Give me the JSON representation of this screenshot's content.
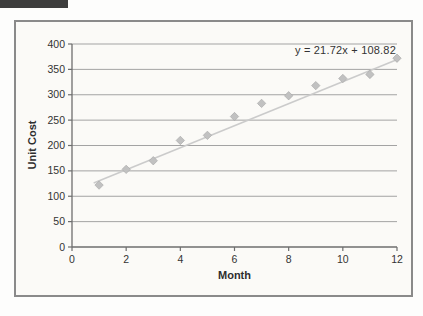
{
  "page": {
    "header_bar_color": "#3d3d3d"
  },
  "chart_data": {
    "type": "scatter",
    "title": "",
    "xlabel": "Month",
    "ylabel": "Unit Cost",
    "x": [
      1,
      2,
      3,
      4,
      5,
      6,
      7,
      8,
      9,
      10,
      11,
      12
    ],
    "y": [
      122,
      153,
      170,
      210,
      220,
      257,
      283,
      298,
      318,
      332,
      340,
      372
    ],
    "trendline": {
      "label": "y = 21.72x + 108.82",
      "slope": 21.72,
      "intercept": 108.82,
      "x_start": 0.8,
      "x_end": 12.1
    },
    "xlim": [
      0,
      12
    ],
    "ylim": [
      0,
      400
    ],
    "x_ticks": [
      0,
      2,
      4,
      6,
      8,
      10,
      12
    ],
    "y_ticks": [
      0,
      50,
      100,
      150,
      200,
      250,
      300,
      350,
      400
    ],
    "grid": "horizontal",
    "legend": "none",
    "marker": "diamond",
    "style": {
      "marker_fill": "#c1c1c1",
      "marker_edge": "#a5a5a5",
      "trendline_color": "#cbcbcb",
      "gridline_color": "#a3a3a3",
      "axis_color": "#6e6e6e",
      "tick_text_color": "#333333",
      "tick_font_size": 10.5
    }
  }
}
